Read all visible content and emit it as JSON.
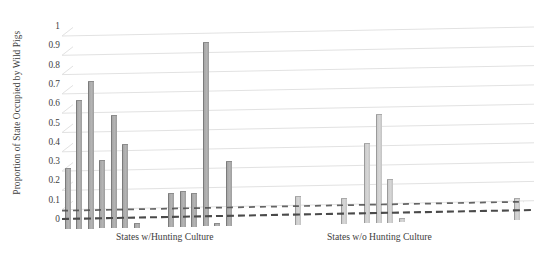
{
  "chart_data": {
    "type": "bar",
    "title": "",
    "xlabel": "",
    "ylabel": "Proportion of State Occupied by Wild Pigs",
    "ylim": [
      0,
      1
    ],
    "yticks": [
      "0",
      "0.1",
      "0.2",
      "0.3",
      "0.4",
      "0.5",
      "0.6",
      "0.7",
      "0.8",
      "0.9",
      "1"
    ],
    "ytick_values": [
      0,
      0.1,
      0.2,
      0.3,
      0.4,
      0.5,
      0.6,
      0.7,
      0.8,
      0.9,
      1
    ],
    "grid": true,
    "legend": null,
    "groups": [
      {
        "label": "States w/Hunting Culture",
        "values": [
          0.31,
          0.66,
          0.76,
          0.35,
          0.58,
          0.43,
          0.02,
          0.0,
          0.0,
          0.17,
          0.18,
          0.17,
          0.95,
          0.01,
          0.33,
          0.0,
          0.0,
          0.0,
          0.0,
          0.0
        ]
      },
      {
        "label": "States w/o Hunting Culture",
        "values": [
          0.14,
          0.0,
          0.0,
          0.0,
          0.13,
          0.0,
          0.41,
          0.56,
          0.22,
          0.02,
          0.0,
          0.0,
          0.0,
          0.0,
          0.0,
          0.0,
          0.0,
          0.0,
          0.0,
          0.11,
          0.0
        ]
      }
    ],
    "values": [
      0.31,
      0.66,
      0.76,
      0.35,
      0.58,
      0.43,
      0.02,
      0.0,
      0.0,
      0.17,
      0.18,
      0.17,
      0.95,
      0.01,
      0.33,
      0.0,
      0.0,
      0.0,
      0.0,
      0.0,
      0.14,
      0.0,
      0.0,
      0.0,
      0.13,
      0.0,
      0.41,
      0.56,
      0.22,
      0.02,
      0.0,
      0.0,
      0.0,
      0.0,
      0.0,
      0.0,
      0.0,
      0.0,
      0.0,
      0.11,
      0.0
    ],
    "bar_shades": [
      "dark",
      "dark",
      "dark",
      "dark",
      "dark",
      "dark",
      "dark",
      "dark",
      "dark",
      "dark",
      "dark",
      "dark",
      "dark",
      "dark",
      "dark",
      "dark",
      "dark",
      "dark",
      "dark",
      "dark",
      "light",
      "light",
      "light",
      "light",
      "light",
      "light",
      "light",
      "light",
      "light",
      "light",
      "light",
      "light",
      "light",
      "light",
      "light",
      "light",
      "light",
      "light",
      "light",
      "light",
      "light"
    ],
    "axis_style": "dashed-baseline",
    "perspective": "slight-3d-skew"
  },
  "colors": {
    "bar_dark": "#b4b4b4",
    "bar_dark_edge": "#7b7b7b",
    "bar_light": "#d6d6d6",
    "bar_light_edge": "#9a9a9a",
    "grid": "#e2e2e2",
    "axis": "#4a4a4a",
    "text": "#3d3d3d",
    "background": "#ffffff"
  }
}
